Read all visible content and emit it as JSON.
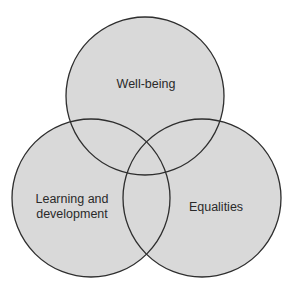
{
  "diagram": {
    "type": "venn",
    "fill_color": "#d9d9d9",
    "stroke_color": "#2e2e2e",
    "background": "#ffffff",
    "circles": [
      {
        "id": "well-being",
        "label": "Well-being",
        "cx": 145,
        "cy": 96,
        "r": 79,
        "label_x": 146,
        "label_y": 84
      },
      {
        "id": "learning-and-development",
        "label_line1": "Learning and",
        "label_line2": "development",
        "cx": 91,
        "cy": 198,
        "r": 79,
        "label_x": 72,
        "label_y": 207
      },
      {
        "id": "equalities",
        "label": "Equalities",
        "cx": 202,
        "cy": 198,
        "r": 79,
        "label_x": 216,
        "label_y": 207
      }
    ]
  }
}
